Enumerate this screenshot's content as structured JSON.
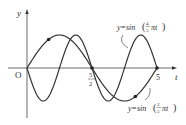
{
  "chart_data": {
    "type": "line",
    "title": "",
    "xlabel": "t",
    "ylabel": "y",
    "origin_label": "O",
    "x_ticks": [
      {
        "value": 2.5,
        "label_num": "5",
        "label_den": "2"
      },
      {
        "value": 5,
        "label": "5"
      }
    ],
    "xlim": [
      0,
      5.3
    ],
    "ylim": [
      -1.2,
      1.3
    ],
    "grid": false,
    "series": [
      {
        "name": "y=sin(4/5 πt)",
        "formula": "sin(4/5 π t)",
        "period": 2.5,
        "amplitude": 1
      },
      {
        "name": "y=sin(2/5 πt)",
        "formula": "sin(2/5 π t)",
        "period": 5,
        "amplitude": 1
      }
    ],
    "intersection_points_t": [
      0,
      0.833,
      2.5,
      4.167,
      5
    ],
    "annotations": [
      {
        "text": "y=sin(4/5 πt)",
        "target": "fast curve",
        "position": "upper right"
      },
      {
        "text": "y=sin(2/5 πt)",
        "target": "slow curve",
        "position": "lower right"
      }
    ]
  },
  "labels": {
    "y_axis": "y",
    "t_axis": "t",
    "origin": "O",
    "tick_half_num": "5",
    "tick_half_den": "2",
    "tick_five": "5",
    "fast_prefix": "y=sin",
    "fast_num": "4",
    "fast_den": "5",
    "fast_suffix": "πt",
    "slow_prefix": "y=sin",
    "slow_num": "2",
    "slow_den": "5",
    "slow_suffix": "πt"
  }
}
